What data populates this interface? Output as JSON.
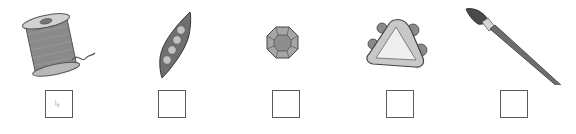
{
  "worksheet": {
    "items": [
      {
        "name": "spool of thread",
        "icon": "thread-spool-icon",
        "checkbox_mark": "↳"
      },
      {
        "name": "pea pod",
        "icon": "pea-pod-icon",
        "checkbox_mark": ""
      },
      {
        "name": "gem",
        "icon": "gem-icon",
        "checkbox_mark": ""
      },
      {
        "name": "triangle tambourine",
        "icon": "tambourine-icon",
        "checkbox_mark": ""
      },
      {
        "name": "paintbrush",
        "icon": "paintbrush-icon",
        "checkbox_mark": ""
      }
    ]
  }
}
